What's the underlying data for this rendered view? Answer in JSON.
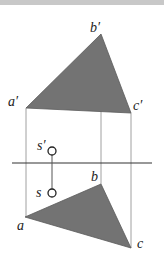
{
  "figure": {
    "type": "orthographic projection of plane triangle and point",
    "colors": {
      "fill": "#757575",
      "line": "#555555",
      "axis": "#333333",
      "proj": "#9a9a9a"
    },
    "labels": {
      "a_prime": "a′",
      "b_prime": "b′",
      "c_prime": "c′",
      "s_prime": "s′",
      "a": "a",
      "b": "b",
      "c": "c",
      "s": "s"
    },
    "front_view": {
      "a_prime": [
        26,
        108
      ],
      "b_prime": [
        101,
        34
      ],
      "c_prime": [
        131,
        113
      ],
      "s_prime": [
        52,
        151
      ]
    },
    "top_view": {
      "a": [
        25,
        217
      ],
      "b": [
        101,
        184
      ],
      "c": [
        131,
        248
      ],
      "s": [
        52,
        193
      ]
    },
    "axis_y": 163
  }
}
